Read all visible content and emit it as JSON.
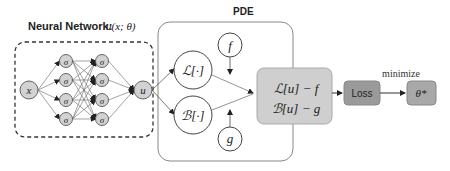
{
  "neural_network": {
    "title": "Neural Network:",
    "title_math": "u(x; θ)",
    "input_label": "x",
    "hidden_label": "σ",
    "output_label": "u",
    "hidden_layers": 2,
    "neurons_per_layer": 4
  },
  "pde": {
    "title": "PDE",
    "operator_L": "ℒ[·]",
    "operator_B": "ℬ[·]",
    "source_f": "f",
    "source_g": "g",
    "residual_line1": "ℒ[u] − f",
    "residual_line2": "ℬ[u] − g"
  },
  "loss": {
    "label": "Loss",
    "minimize_label": "minimize",
    "result_label": "θ*"
  },
  "colors": {
    "node_fill": "#d2d2d2",
    "residual_fill": "#cfcfcf",
    "loss_fill": "#9a9a9a",
    "result_fill": "#a8a8a8",
    "stroke": "#555555"
  }
}
